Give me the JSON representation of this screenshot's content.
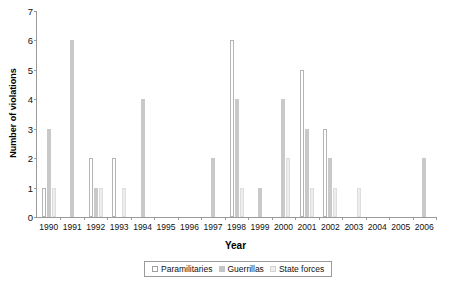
{
  "chart": {
    "type": "bar",
    "title": "",
    "xlabel": "Year",
    "ylabel": "Number of violations"
  },
  "axis": {
    "y_ticks": [
      "0",
      "1",
      "2",
      "3",
      "4",
      "5",
      "6",
      "7"
    ],
    "x_ticks": [
      "1990",
      "1991",
      "1992",
      "1993",
      "1994",
      "1995",
      "1996",
      "1997",
      "1998",
      "1999",
      "2000",
      "2001",
      "2002",
      "2003",
      "2004",
      "2005",
      "2006"
    ]
  },
  "legend": {
    "items": [
      {
        "label": "Paramilitaries",
        "swatch": "para",
        "color": "#ffffff"
      },
      {
        "label": "Guerrillas",
        "swatch": "guer",
        "color": "#c4c4c4"
      },
      {
        "label": "State forces",
        "swatch": "state",
        "color": "#ededed"
      }
    ]
  },
  "chart_data": {
    "type": "bar",
    "title": "",
    "xlabel": "Year",
    "ylabel": "Number of violations",
    "ylim": [
      0,
      7
    ],
    "yticks": [
      0,
      1,
      2,
      3,
      4,
      5,
      6,
      7
    ],
    "grid": false,
    "legend_position": "bottom",
    "categories": [
      "1990",
      "1991",
      "1992",
      "1993",
      "1994",
      "1995",
      "1996",
      "1997",
      "1998",
      "1999",
      "2000",
      "2001",
      "2002",
      "2003",
      "2004",
      "2005",
      "2006"
    ],
    "series": [
      {
        "name": "Paramilitaries",
        "color": "#ffffff",
        "values": [
          1,
          0,
          2,
          2,
          0,
          0,
          0,
          0,
          6,
          0,
          0,
          5,
          3,
          0,
          0,
          0,
          0
        ]
      },
      {
        "name": "Guerrillas",
        "color": "#c4c4c4",
        "values": [
          3,
          6,
          1,
          0,
          4,
          0,
          0,
          2,
          4,
          1,
          4,
          3,
          2,
          0,
          0,
          0,
          2
        ]
      },
      {
        "name": "State forces",
        "color": "#ededed",
        "values": [
          1,
          0,
          1,
          1,
          0,
          0,
          0,
          0,
          1,
          0,
          2,
          1,
          1,
          1,
          0,
          0,
          0
        ]
      }
    ]
  }
}
